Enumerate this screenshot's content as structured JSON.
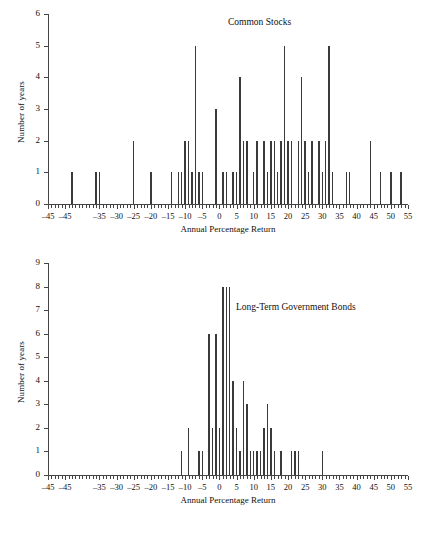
{
  "figure": {
    "background": "#ffffff",
    "bar_color": "#3a3a3a",
    "axis_color": "#444444"
  },
  "chart_data": [
    {
      "id": "common-stocks",
      "type": "bar",
      "title": "Common Stocks",
      "xlabel": "Annual Percentage Return",
      "ylabel": "Number of years",
      "xlim": [
        -50,
        55
      ],
      "ylim": [
        0,
        6
      ],
      "grid": false,
      "legend": "none",
      "ytick_labels": [
        "0",
        "1",
        "2",
        "3",
        "4",
        "5",
        "6"
      ],
      "ytick_values": [
        0,
        1,
        2,
        3,
        4,
        5,
        6
      ],
      "xtick_labels": [
        "–45",
        "–45",
        "–35",
        "–30",
        "–25",
        "–20",
        "–15",
        "–10",
        "–5",
        "0",
        "5",
        "10",
        "15",
        "20",
        "25",
        "30",
        "35",
        "40",
        "45",
        "50",
        "55"
      ],
      "xtick_values": [
        -50,
        -45,
        -35,
        -30,
        -25,
        -20,
        -15,
        -10,
        -5,
        0,
        5,
        10,
        15,
        20,
        25,
        30,
        35,
        40,
        45,
        50,
        55
      ],
      "minor_tick_step": 1,
      "x": [
        -43,
        -36,
        -35,
        -25,
        -20,
        -14,
        -12,
        -11,
        -10,
        -9,
        -8,
        -7,
        -6,
        -5,
        -1,
        1,
        2,
        4,
        5,
        6,
        7,
        8,
        10,
        11,
        13,
        14,
        15,
        16,
        17,
        18,
        19,
        20,
        21,
        23,
        24,
        25,
        26,
        27,
        29,
        30,
        31,
        32,
        33,
        37,
        38,
        44,
        47,
        50,
        53
      ],
      "values": [
        1,
        1,
        1,
        2,
        1,
        1,
        1,
        1,
        2,
        2,
        1,
        5,
        1,
        1,
        3,
        1,
        1,
        1,
        1,
        4,
        2,
        2,
        1,
        2,
        2,
        1,
        2,
        2,
        1,
        2,
        5,
        2,
        2,
        2,
        4,
        2,
        1,
        2,
        2,
        1,
        2,
        5,
        1,
        1,
        1,
        2,
        1,
        1,
        1
      ]
    },
    {
      "id": "long-term-government-bonds",
      "type": "bar",
      "title": "Long-Term Government Bonds",
      "xlabel": "Annual Percentage Return",
      "ylabel": "Number of years",
      "xlim": [
        -50,
        55
      ],
      "ylim": [
        0,
        9
      ],
      "grid": false,
      "legend": "none",
      "ytick_labels": [
        "0",
        "1",
        "2",
        "3",
        "4",
        "5",
        "6",
        "7",
        "8",
        "9"
      ],
      "ytick_values": [
        0,
        1,
        2,
        3,
        4,
        5,
        6,
        7,
        8,
        9
      ],
      "xtick_labels": [
        "–45",
        "–45",
        "–35",
        "–30",
        "–25",
        "–20",
        "–15",
        "–10",
        "–5",
        "0",
        "5",
        "10",
        "15",
        "20",
        "25",
        "30",
        "35",
        "40",
        "45",
        "50",
        "55"
      ],
      "xtick_values": [
        -50,
        -45,
        -35,
        -30,
        -25,
        -20,
        -15,
        -10,
        -5,
        0,
        5,
        10,
        15,
        20,
        25,
        30,
        35,
        40,
        45,
        50,
        55
      ],
      "minor_tick_step": 1,
      "x": [
        -11,
        -9,
        -6,
        -5,
        -3,
        -2,
        -1,
        0,
        1,
        2,
        3,
        4,
        5,
        6,
        7,
        8,
        9,
        10,
        11,
        12,
        13,
        14,
        15,
        16,
        18,
        21,
        22,
        23,
        30
      ],
      "values": [
        1,
        2,
        1,
        1,
        6,
        2,
        6,
        2,
        8,
        8,
        8,
        4,
        2,
        1,
        4,
        3,
        1,
        1,
        1,
        1,
        2,
        3,
        2,
        1,
        1,
        1,
        1,
        1,
        1
      ]
    }
  ]
}
